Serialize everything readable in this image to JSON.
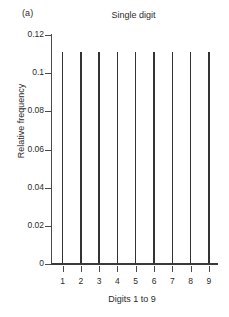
{
  "panel": {
    "label": "(a)"
  },
  "chart_data": {
    "type": "bar",
    "title": "Single digit",
    "xlabel": "Digits 1 to 9",
    "ylabel": "Relative frequency",
    "categories": [
      "1",
      "2",
      "3",
      "4",
      "5",
      "6",
      "7",
      "8",
      "9"
    ],
    "values": [
      0.111,
      0.111,
      0.111,
      0.111,
      0.111,
      0.111,
      0.111,
      0.111,
      0.111
    ],
    "ylim": [
      0,
      0.125
    ],
    "yticks": [
      0,
      0.02,
      0.04,
      0.06,
      0.08,
      0.1,
      0.12
    ],
    "ytick_labels": [
      "0",
      "0.02",
      "0.04",
      "0.06",
      "0.08",
      "0.1",
      "0.12"
    ],
    "xtick_labels": [
      "1",
      "2",
      "3",
      "4",
      "5",
      "6",
      "7",
      "8",
      "9"
    ],
    "grid": false,
    "legend": null,
    "bar_color": "#333333",
    "axis_color": "#4a4a4a"
  }
}
